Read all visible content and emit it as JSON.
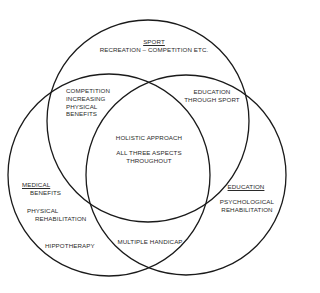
{
  "diagram": {
    "type": "venn",
    "circles": [
      {
        "id": "sport",
        "cx": 148,
        "cy": 121,
        "r": 101
      },
      {
        "id": "medical",
        "cx": 109,
        "cy": 175,
        "r": 101
      },
      {
        "id": "education",
        "cx": 186,
        "cy": 175,
        "r": 100
      }
    ],
    "stroke_color": "#1a1a1a"
  },
  "labels": {
    "sport": {
      "title": "SPORT",
      "subtitle": "RECREATION – COMPETITION ETC."
    },
    "sport_medical": {
      "lines": [
        "COMPETITION",
        "INCREASING",
        "PHYSICAL",
        "BENEFITS"
      ]
    },
    "sport_education": {
      "lines": [
        "EDUCATION",
        "THROUGH SPORT"
      ]
    },
    "center": {
      "line1": "HOLISTIC APPROACH",
      "line2": "ALL THREE ASPECTS",
      "line3": "THROUGHOUT"
    },
    "medical": {
      "title": "MEDICAL",
      "title2": "BENEFITS",
      "item1a": "PHYSICAL",
      "item1b": "REHABILITATION",
      "item2": "HIPPOTHERAPY"
    },
    "education": {
      "title": "EDUCATION",
      "item1a": "PSYCHOLOGICAL",
      "item1b": "REHABILITATION"
    },
    "medical_education": {
      "text": "MULTIPLE HANDICAP"
    }
  }
}
